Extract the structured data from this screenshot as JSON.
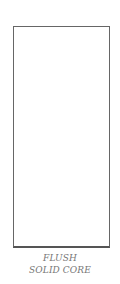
{
  "diagram": {
    "shape": "door-elevation",
    "stroke_color": "#666666",
    "fill_color": "#ffffff"
  },
  "caption": {
    "line1": "FLUSH",
    "line2": "SOLID CORE",
    "color": "#777777"
  }
}
